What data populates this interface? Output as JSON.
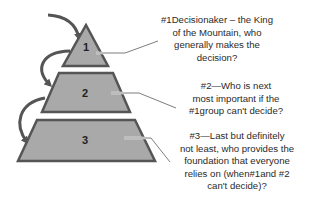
{
  "colors": {
    "fill": "#a9a9a9",
    "stroke": "#555555",
    "arrow": "#555555",
    "leader": "#6e6e6e",
    "text": "#2a2a2a"
  },
  "tiers": [
    {
      "label": "1"
    },
    {
      "label": "2"
    },
    {
      "label": "3"
    }
  ],
  "callouts": [
    {
      "lines": [
        "#1Decisionaker – the King",
        "of the Mountain, who",
        "generally makes the",
        "decision?"
      ]
    },
    {
      "lines": [
        "#2—Who is next",
        "most important if the",
        "#1group can't decide?"
      ]
    },
    {
      "lines": [
        "#3—Last but definitely",
        "not least, who provides the",
        "foundation that everyone",
        "relies on (when#1and #2",
        "can't decide)?"
      ]
    }
  ]
}
